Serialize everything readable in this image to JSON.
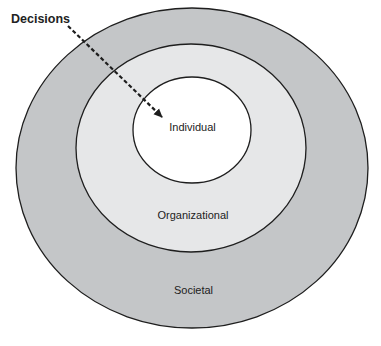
{
  "diagram": {
    "type": "nested-ellipses",
    "pointer_label": "Decisions",
    "layers": [
      {
        "id": "societal",
        "label": "Societal",
        "fill": "#c4c6c8"
      },
      {
        "id": "organizational",
        "label": "Organizational",
        "fill": "#e6e7e8"
      },
      {
        "id": "individual",
        "label": "Individual",
        "fill": "#ffffff"
      }
    ],
    "stroke": "#1e1e1e",
    "arrow": {
      "style": "dashed",
      "from": "Decisions",
      "to": "Individual"
    }
  }
}
